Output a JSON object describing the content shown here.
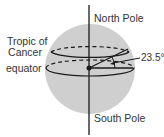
{
  "diagram": {
    "labels": {
      "north_pole": "North Pole",
      "south_pole": "South Pole",
      "tropic_of_cancer_line1": "Tropic of",
      "tropic_of_cancer_line2": "Cancer",
      "equator": "equator",
      "angle": "23.5°"
    },
    "colors": {
      "sphere_fill": "#cfcfcf",
      "line": "#1a1a1a",
      "text": "#333333",
      "background": "#ffffff"
    }
  }
}
